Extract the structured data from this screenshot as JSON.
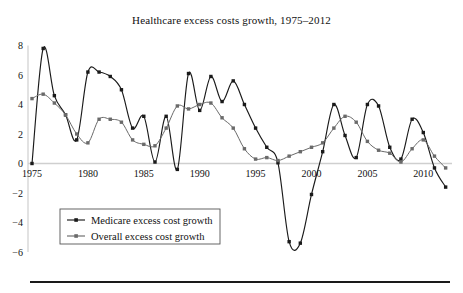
{
  "chart_data": {
    "type": "line",
    "title": "Healthcare excess costs growth, 1975–2012",
    "xlabel": "",
    "ylabel": "",
    "xlim": [
      1975,
      2012
    ],
    "ylim": [
      -6,
      8
    ],
    "grid": false,
    "zero_line": true,
    "legend_position": "lower-left",
    "xticks": [
      1975,
      1980,
      1985,
      1990,
      1995,
      2000,
      2005,
      2010
    ],
    "xtick_labels": [
      "1975",
      "1980",
      "1985",
      "1990",
      "1995",
      "2000",
      "2005",
      "2010"
    ],
    "yticks": [
      -6,
      -4,
      -2,
      0,
      2,
      4,
      6,
      8
    ],
    "ytick_labels": [
      "−6",
      "−4",
      "−2",
      "0",
      "2",
      "4",
      "6",
      "8"
    ],
    "x": [
      1975,
      1976,
      1977,
      1978,
      1979,
      1980,
      1981,
      1982,
      1983,
      1984,
      1985,
      1986,
      1987,
      1988,
      1989,
      1990,
      1991,
      1992,
      1993,
      1994,
      1995,
      1996,
      1997,
      1998,
      1999,
      2000,
      2001,
      2002,
      2003,
      2004,
      2005,
      2006,
      2007,
      2008,
      2009,
      2010,
      2011,
      2012
    ],
    "series": [
      {
        "name": "Medicare excess cost growth",
        "color": "#1a1a1a",
        "marker": "square",
        "values": [
          0.0,
          7.8,
          4.6,
          3.3,
          1.6,
          6.2,
          6.2,
          5.9,
          5.0,
          2.4,
          3.2,
          0.1,
          3.2,
          -0.4,
          6.1,
          3.6,
          5.9,
          4.2,
          5.6,
          4.0,
          2.4,
          1.1,
          0.05,
          -5.3,
          -5.4,
          -2.1,
          0.8,
          4.0,
          1.9,
          0.4,
          4.0,
          3.9,
          1.1,
          0.3,
          3.0,
          2.1,
          -0.3,
          -1.6
        ]
      },
      {
        "name": "Overall excess cost growth",
        "color": "#6a6a6a",
        "marker": "square",
        "values": [
          4.4,
          4.7,
          4.1,
          3.3,
          2.0,
          1.4,
          3.0,
          3.0,
          2.8,
          1.6,
          1.3,
          1.2,
          2.4,
          3.9,
          3.7,
          4.0,
          4.1,
          3.1,
          2.4,
          1.0,
          0.3,
          0.4,
          0.2,
          0.5,
          0.8,
          1.1,
          1.4,
          2.4,
          3.2,
          2.8,
          1.5,
          0.9,
          0.7,
          0.1,
          1.0,
          1.6,
          0.5,
          -0.3
        ]
      }
    ]
  },
  "legend": {
    "entries": [
      {
        "label": "Medicare excess cost growth"
      },
      {
        "label": "Overall excess cost growth"
      }
    ]
  },
  "colors": {
    "medicare": "#1a1a1a",
    "overall": "#6a6a6a",
    "axis": "#cfcfcf",
    "text": "#111111",
    "rule": "#1a1a1a"
  }
}
